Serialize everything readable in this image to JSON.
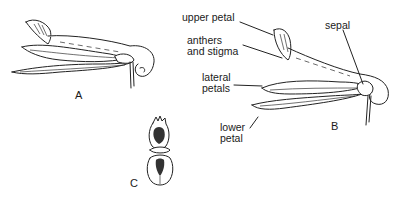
{
  "figure": {
    "panels": [
      {
        "id": "A",
        "label": "A",
        "description": "side view of flower"
      },
      {
        "id": "B",
        "label": "B",
        "description": "side view of flower with labelled parts"
      },
      {
        "id": "C",
        "label": "C",
        "description": "front view of flower"
      }
    ],
    "annotations": {
      "upper_petal": "upper petal",
      "anthers_line1": "anthers",
      "anthers_line2": "and stigma",
      "lateral_line1": "lateral",
      "lateral_line2": "petals",
      "lower_line1": "lower",
      "lower_line2": "petal",
      "sepal": "sepal"
    },
    "colors": {
      "ink": "#222222",
      "background": "#ffffff"
    }
  }
}
